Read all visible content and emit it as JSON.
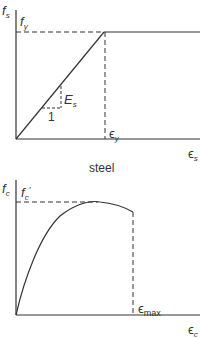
{
  "diagrams": [
    {
      "id": "steel",
      "caption": "steel",
      "y_axis": {
        "symbol": "f",
        "subscript": "s"
      },
      "x_axis": {
        "symbol": "ϵ",
        "subscript": "s"
      },
      "yield_label": {
        "symbol": "f",
        "subscript": "y"
      },
      "yield_strain_label": {
        "symbol": "ϵ",
        "subscript": "y"
      },
      "modulus_label": {
        "symbol": "E",
        "subscript": "s"
      },
      "slope_run_label": "1",
      "curve": "elastic-perfectly-plastic"
    },
    {
      "id": "concrete",
      "caption": "",
      "y_axis": {
        "symbol": "f",
        "subscript": "c"
      },
      "x_axis": {
        "symbol": "ϵ",
        "subscript": "c"
      },
      "peak_label": {
        "symbol": "f",
        "subscript": "c",
        "prime": "′"
      },
      "max_strain_label": {
        "symbol": "ϵ",
        "subscript": "max"
      },
      "curve": "parabolic-rise-then-descending"
    }
  ],
  "colors": {
    "line": "#333333",
    "background": "#ffffff"
  }
}
